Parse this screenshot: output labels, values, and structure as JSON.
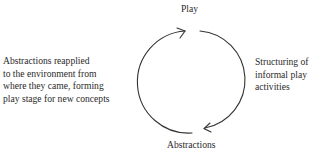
{
  "diagram": {
    "type": "cycle",
    "nodes": {
      "top": "Play",
      "bottom": "Abstractions"
    },
    "edges": {
      "right": {
        "from": "Play",
        "to": "Abstractions",
        "label_lines": [
          "Structuring of",
          "informal play",
          "activities"
        ]
      },
      "left": {
        "from": "Abstractions",
        "to": "Play",
        "label_lines": [
          "Abstractions reapplied",
          "to the environment from",
          "where they came, forming",
          "play stage for new concepts"
        ]
      }
    },
    "colors": {
      "stroke": "#333333",
      "text": "#2a2a2a"
    }
  }
}
